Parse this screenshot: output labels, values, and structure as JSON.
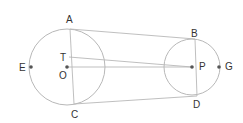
{
  "diagram": {
    "type": "two-circles-geometry",
    "colors": {
      "stroke": "#b8b8b8",
      "point": "#555555",
      "label": "#333333"
    },
    "circles": [
      {
        "name": "circle-O",
        "cx": 67,
        "cy": 67,
        "r": 38
      },
      {
        "name": "circle-P",
        "cx": 192,
        "cy": 67,
        "r": 28
      }
    ],
    "points": {
      "A": {
        "x": 70,
        "y": 29,
        "label": "A",
        "lx": 66,
        "ly": 23
      },
      "C": {
        "x": 74,
        "y": 104,
        "label": "C",
        "lx": 71,
        "ly": 118
      },
      "E": {
        "x": 31,
        "y": 67,
        "label": "E",
        "lx": 19,
        "ly": 71
      },
      "T": {
        "x": 69,
        "y": 57,
        "label": "T",
        "lx": 60,
        "ly": 61
      },
      "O": {
        "x": 67,
        "y": 67,
        "label": "O",
        "lx": 59,
        "ly": 79
      },
      "B": {
        "x": 195,
        "y": 39,
        "label": "B",
        "lx": 191,
        "ly": 37
      },
      "D": {
        "x": 197,
        "y": 96,
        "label": "D",
        "lx": 193,
        "ly": 108
      },
      "P": {
        "x": 192,
        "y": 67,
        "label": "P",
        "lx": 199,
        "ly": 68
      },
      "G": {
        "x": 219,
        "y": 67,
        "label": "G",
        "lx": 225,
        "ly": 67
      }
    },
    "segments": [
      [
        "A",
        "C"
      ],
      [
        "B",
        "D"
      ],
      [
        "A",
        "B"
      ],
      [
        "C",
        "D"
      ],
      [
        "T",
        "P"
      ],
      [
        "O",
        "P"
      ]
    ],
    "labels": {
      "A": "A",
      "B": "B",
      "C": "C",
      "D": "D",
      "E": "E",
      "G": "G",
      "O": "O",
      "P": "P",
      "T": "T"
    }
  }
}
